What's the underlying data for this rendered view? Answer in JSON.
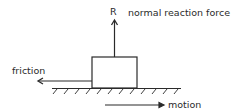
{
  "diagram": {
    "type": "free-body force diagram",
    "colors": {
      "stroke": "#2a2a2a",
      "background": "#ffffff"
    },
    "labels": {
      "reaction_symbol": "R",
      "reaction": "normal reaction force",
      "friction": "friction",
      "motion": "motion"
    },
    "elements": {
      "block": "rectangular block resting on a hatched rough surface",
      "surface": "hatched ground line",
      "arrows": [
        "upward normal reaction R",
        "leftward friction",
        "rightward motion"
      ]
    }
  }
}
